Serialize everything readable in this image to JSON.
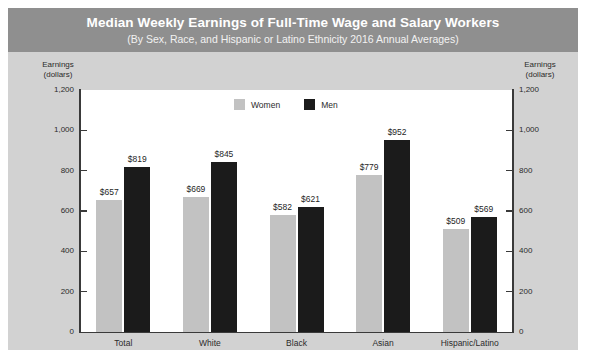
{
  "banner": {
    "title": "Median Weekly Earnings of Full-Time Wage and Salary Workers",
    "subtitle": "(By Sex, Race, and Hispanic or Latino Ethnicity 2016 Annual Averages)"
  },
  "axis_caption_left_line1": "Earnings",
  "axis_caption_left_line2": "(dollars)",
  "axis_caption_right_line1": "Earnings",
  "axis_caption_right_line2": "(dollars)",
  "colors": {
    "banner_bg": "#8f8f8f",
    "card_bg": "#d2d2d2",
    "plot_bg": "#ffffff",
    "women": "#c2c2c2",
    "men": "#1b1b1b",
    "axis": "#3a3a3a"
  },
  "chart_data": {
    "type": "bar",
    "title": "Median Weekly Earnings of Full-Time Wage and Salary Workers",
    "subtitle": "(By Sex, Race, and Hispanic or Latino Ethnicity 2016 Annual Averages)",
    "xlabel": "",
    "ylabel": "Earnings (dollars)",
    "ylim": [
      0,
      1200
    ],
    "yticks": [
      0,
      200,
      400,
      600,
      800,
      1000,
      1200
    ],
    "ytick_labels": [
      "0",
      "200",
      "400",
      "600",
      "800",
      "1,000",
      "1,200"
    ],
    "grid": false,
    "legend_position": "top-center",
    "dual_axis": true,
    "categories": [
      "Total",
      "White",
      "Black",
      "Asian",
      "Hispanic/Latino"
    ],
    "series": [
      {
        "name": "Women",
        "color": "#c2c2c2",
        "values": [
          657,
          669,
          582,
          779,
          509
        ],
        "data_labels": [
          "$657",
          "$669",
          "$582",
          "$779",
          "$509"
        ]
      },
      {
        "name": "Men",
        "color": "#1b1b1b",
        "values": [
          819,
          845,
          621,
          952,
          569
        ],
        "data_labels": [
          "$819",
          "$845",
          "$621",
          "$952",
          "$569"
        ]
      }
    ]
  }
}
